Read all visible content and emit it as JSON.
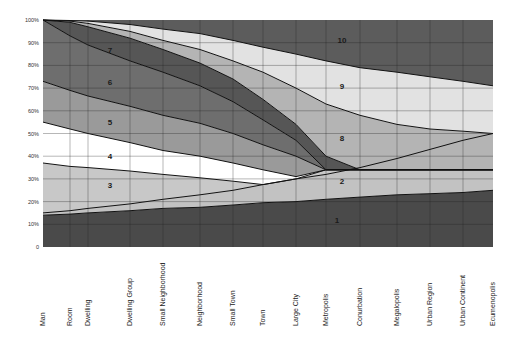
{
  "chart_data": {
    "type": "area",
    "title": "",
    "xlabel": "",
    "ylabel": "",
    "ylim": [
      0,
      100
    ],
    "y_ticks": [
      "0",
      "10%",
      "20%",
      "30%",
      "40%",
      "50%",
      "60%",
      "70%",
      "80%",
      "90%",
      "100%"
    ],
    "grid": true,
    "legend": "band numbers labeled inside areas",
    "categories": [
      "Man",
      "Room",
      "Dwelling",
      "Dwelling Group",
      "Small Neighborhood",
      "Neighborhood",
      "Small Town",
      "Town",
      "Large City",
      "Metropolis",
      "Conurbation",
      "Megalopolis",
      "Urban Region",
      "Urban Continent",
      "Ecumenopolis"
    ],
    "boundaries": [
      {
        "name": "top of band 1",
        "values": [
          14,
          14.5,
          15,
          16,
          17,
          17.5,
          18.5,
          19.5,
          20,
          21,
          22,
          23,
          23.5,
          24,
          25
        ]
      },
      {
        "name": "top of band 2 (lower edge of 3 / 8)",
        "values": [
          15,
          16,
          17,
          19,
          21,
          23,
          25,
          27.5,
          30,
          32,
          35,
          39,
          43,
          47,
          50
        ]
      },
      {
        "name": "top of band 3",
        "values": [
          37,
          35.5,
          35,
          33.5,
          32,
          30.5,
          29,
          27.5,
          30,
          34,
          34,
          34,
          34,
          34,
          34
        ]
      },
      {
        "name": "top of band 4",
        "values": [
          55,
          52,
          50,
          46,
          42.5,
          40,
          37,
          34,
          31,
          34,
          34,
          34,
          34,
          34,
          34
        ]
      },
      {
        "name": "top of band 5",
        "values": [
          73,
          69,
          66.5,
          62,
          58,
          54.5,
          50,
          45,
          40,
          34,
          34,
          34,
          34,
          34,
          34
        ]
      },
      {
        "name": "top of band 6",
        "values": [
          100,
          93,
          89,
          82,
          77,
          71,
          64,
          56,
          47,
          34,
          34,
          34,
          34,
          34,
          34
        ]
      },
      {
        "name": "top of band 7",
        "values": [
          100,
          99,
          97,
          92,
          87,
          81,
          74,
          65,
          54,
          40,
          34,
          34,
          34,
          34,
          34
        ]
      },
      {
        "name": "top of band 8",
        "values": [
          100,
          99.5,
          98.5,
          95,
          91,
          87,
          82,
          77,
          70,
          63,
          58,
          54,
          52,
          51,
          50
        ]
      },
      {
        "name": "top of band 9",
        "values": [
          100,
          99.8,
          99.5,
          98,
          96,
          94,
          91,
          88,
          85,
          82,
          79,
          77,
          75,
          73,
          71
        ]
      }
    ],
    "bands": [
      {
        "label": "1",
        "color": "#4a4a4a",
        "label_pos": [
          337,
          223
        ]
      },
      {
        "label": "2",
        "color": "#c2c2c2",
        "label_pos": [
          342,
          184
        ]
      },
      {
        "label": "3",
        "color": "#c8c8c8",
        "label_pos": [
          110,
          188
        ]
      },
      {
        "label": "4",
        "color": "#ffffff",
        "label_pos": [
          110,
          159
        ]
      },
      {
        "label": "5",
        "color": "#9a9a9a",
        "label_pos": [
          110,
          125
        ]
      },
      {
        "label": "6",
        "color": "#6e6e6e",
        "label_pos": [
          110,
          85
        ]
      },
      {
        "label": "7",
        "color": "#565656",
        "label_pos": [
          110,
          53
        ]
      },
      {
        "label": "8",
        "color": "#b4b4b4",
        "label_pos": [
          342,
          141
        ]
      },
      {
        "label": "9",
        "color": "#e2e2e2",
        "label_pos": [
          342,
          89
        ]
      },
      {
        "label": "10",
        "color": "#5c5c5c",
        "label_pos": [
          342,
          43
        ]
      }
    ]
  }
}
